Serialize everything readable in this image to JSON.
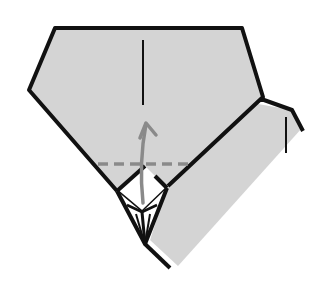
{
  "diagram": {
    "type": "origami-fold-step",
    "colors": {
      "paper": "#d4d4d4",
      "outline": "#111111",
      "arrow": "#8a8a8a",
      "fold_line": "#8a8a8a",
      "background": "#ffffff"
    },
    "elements": {
      "main_shape": "pentagon-paper",
      "right_flap": "folded-side-flap",
      "center_crease": "vertical-crease",
      "fold_line": "valley-fold-dashed-line",
      "arrow": "fold-up-arrow",
      "bottom_pocket": "white-square-pocket"
    }
  }
}
